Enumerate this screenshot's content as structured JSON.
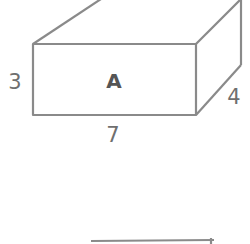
{
  "figure": {
    "shape": "rectangular-prism",
    "face_label": "A",
    "dimensions": {
      "height": "3",
      "length": "7",
      "depth": "4"
    }
  },
  "colors": {
    "stroke": "#8a8a8a",
    "label": "#6f6f6f",
    "face_label": "#555555"
  }
}
